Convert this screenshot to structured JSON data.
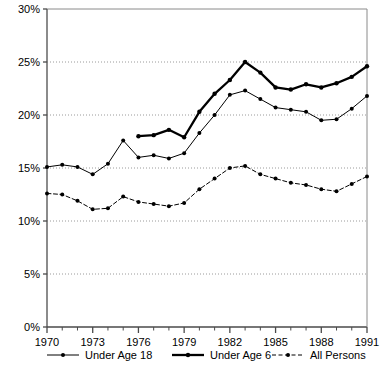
{
  "chart_data": {
    "type": "line",
    "title": "",
    "subtitle": "",
    "xlabel": "",
    "ylabel": "",
    "xlim": [
      1970,
      1991
    ],
    "ylim": [
      0,
      30
    ],
    "grid": "horizontal-dotted",
    "legend_position": "bottom",
    "x": [
      1970,
      1971,
      1972,
      1973,
      1974,
      1975,
      1976,
      1977,
      1978,
      1979,
      1980,
      1981,
      1982,
      1983,
      1984,
      1985,
      1986,
      1987,
      1988,
      1989,
      1990,
      1991
    ],
    "y_tick_labels": [
      "0%",
      "5%",
      "10%",
      "15%",
      "20%",
      "25%",
      "30%"
    ],
    "y_tick_values": [
      0,
      5,
      10,
      15,
      20,
      25,
      30
    ],
    "x_tick_labels": [
      "1970",
      "1973",
      "1976",
      "1979",
      "1982",
      "1985",
      "1988",
      "1991"
    ],
    "x_tick_values": [
      1970,
      1973,
      1976,
      1979,
      1982,
      1985,
      1988,
      1991
    ],
    "x_minor_ticks": [
      1971,
      1972,
      1974,
      1975,
      1977,
      1978,
      1980,
      1981,
      1983,
      1984,
      1986,
      1987,
      1989,
      1990
    ],
    "series": [
      {
        "name": "Under Age 18",
        "style": "solid-thin-marker",
        "color": "#000000",
        "x": [
          1970,
          1971,
          1972,
          1973,
          1974,
          1975,
          1976,
          1977,
          1978,
          1979,
          1980,
          1981,
          1982,
          1983,
          1984,
          1985,
          1986,
          1987,
          1988,
          1989,
          1990,
          1991
        ],
        "values": [
          15.1,
          15.3,
          15.1,
          14.4,
          15.4,
          17.6,
          16.0,
          16.2,
          15.9,
          16.4,
          18.3,
          20.0,
          21.9,
          22.3,
          21.5,
          20.7,
          20.5,
          20.3,
          19.5,
          19.6,
          20.6,
          21.8
        ]
      },
      {
        "name": "Under Age 6",
        "style": "solid-thick-marker",
        "color": "#000000",
        "x": [
          1976,
          1977,
          1978,
          1979,
          1980,
          1981,
          1982,
          1983,
          1984,
          1985,
          1986,
          1987,
          1988,
          1989,
          1990,
          1991
        ],
        "values": [
          18.0,
          18.1,
          18.6,
          17.9,
          20.3,
          22.0,
          23.3,
          25.0,
          24.0,
          22.6,
          22.4,
          22.9,
          22.6,
          23.0,
          23.6,
          24.6
        ]
      },
      {
        "name": "All Persons",
        "style": "dashed-marker",
        "color": "#000000",
        "x": [
          1970,
          1971,
          1972,
          1973,
          1974,
          1975,
          1976,
          1977,
          1978,
          1979,
          1980,
          1981,
          1982,
          1983,
          1984,
          1985,
          1986,
          1987,
          1988,
          1989,
          1990,
          1991
        ],
        "values": [
          12.6,
          12.5,
          11.9,
          11.1,
          11.2,
          12.3,
          11.8,
          11.6,
          11.4,
          11.7,
          13.0,
          14.0,
          15.0,
          15.2,
          14.4,
          14.0,
          13.6,
          13.4,
          13.0,
          12.8,
          13.5,
          14.2
        ]
      }
    ],
    "legend": [
      {
        "label": "Under Age 18",
        "style": "solid-thin-marker"
      },
      {
        "label": "Under Age 6",
        "style": "solid-thick-marker"
      },
      {
        "label": "All Persons",
        "style": "dashed-marker"
      }
    ]
  }
}
